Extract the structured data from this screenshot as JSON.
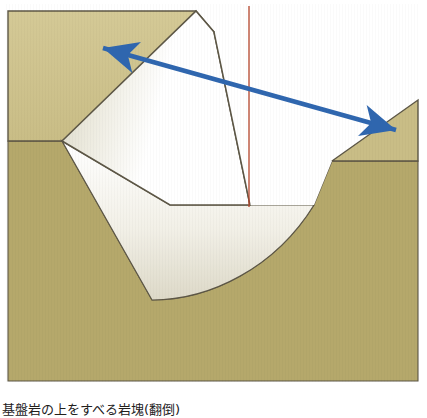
{
  "figure": {
    "domain": "diagram",
    "kind": "geological-cross-section",
    "width": 427,
    "height": 418,
    "background_color": "#ffffff",
    "caption": {
      "text": "基盤岩の上をすべる岩塊(翻倒)",
      "visible": "partially-cropped-at-bottom-edge"
    }
  },
  "palette": {
    "upper_terrace_fill": "#cfc48f",
    "lower_bedrock_fill": "#b5a86b",
    "right_slope_fill": "#c6ba86",
    "block_fill_light": "#ffffff",
    "block_fill_shade": "#d8d5c4",
    "outline_stroke": "#5d5746",
    "arrow_blue": "#2f66ae",
    "reference_line_red": "#b4442a"
  },
  "elements": {
    "upper_terrace": {
      "name": "upper-terrace-surface",
      "label": "upper ground surface (left terrace)"
    },
    "lower_bedrock": {
      "name": "lower-bedrock-mass",
      "label": "bedrock below slip surface"
    },
    "right_slope": {
      "name": "right-slope-face",
      "label": "right descending slope"
    },
    "toppling_block": {
      "name": "toppling-rock-block",
      "label": "rotated / toppled rock block"
    },
    "slip_surface": {
      "name": "curved-slip-surface",
      "label": "concave curved sliding plane"
    },
    "motion_arrow": {
      "name": "double-headed-motion-arrow",
      "label": "direction of block displacement",
      "head_left_at": "100,47",
      "head_right_at": "400,131",
      "color": "#2f66ae"
    },
    "vertical_reference": {
      "name": "vertical-reference-line",
      "label": "vertical datum line",
      "color": "#b4442a",
      "x": 249,
      "y_top": 6,
      "y_bottom": 207
    }
  }
}
